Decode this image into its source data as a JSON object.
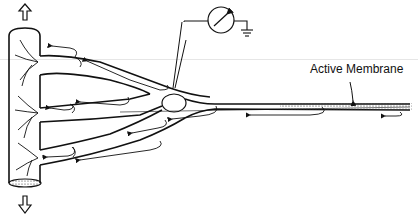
{
  "diagram": {
    "labels": {
      "active_membrane": "Active Membrane"
    },
    "elements": {
      "arrow_up": "hollow-up-arrow-icon",
      "arrow_down": "hollow-down-arrow-icon",
      "meter": "voltmeter-icon",
      "ground": "ground-icon",
      "electrode": "microelectrode"
    },
    "colors": {
      "stroke": "#111111",
      "background": "#ffffff"
    }
  }
}
